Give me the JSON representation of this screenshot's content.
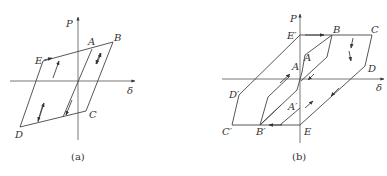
{
  "panel_a": {
    "caption": "(a)",
    "axis_y_label": "P",
    "axis_x_label": "δ",
    "points": {
      "A": "A",
      "B": "B",
      "C": "C",
      "D": "D",
      "E": "E"
    }
  },
  "panel_b": {
    "caption": "(b)",
    "axis_y_label": "P",
    "axis_x_label": "δ",
    "points": {
      "A_upper": "A",
      "A_lower": "A",
      "A_prime": "A′",
      "B": "B",
      "B_prime": "B′",
      "C": "C",
      "C_prime": "C′",
      "D": "D",
      "D_prime": "D′",
      "E": "E",
      "E_prime": "E′"
    }
  },
  "colors": {
    "line": "#444444",
    "text": "#333333",
    "background": "#ffffff"
  }
}
